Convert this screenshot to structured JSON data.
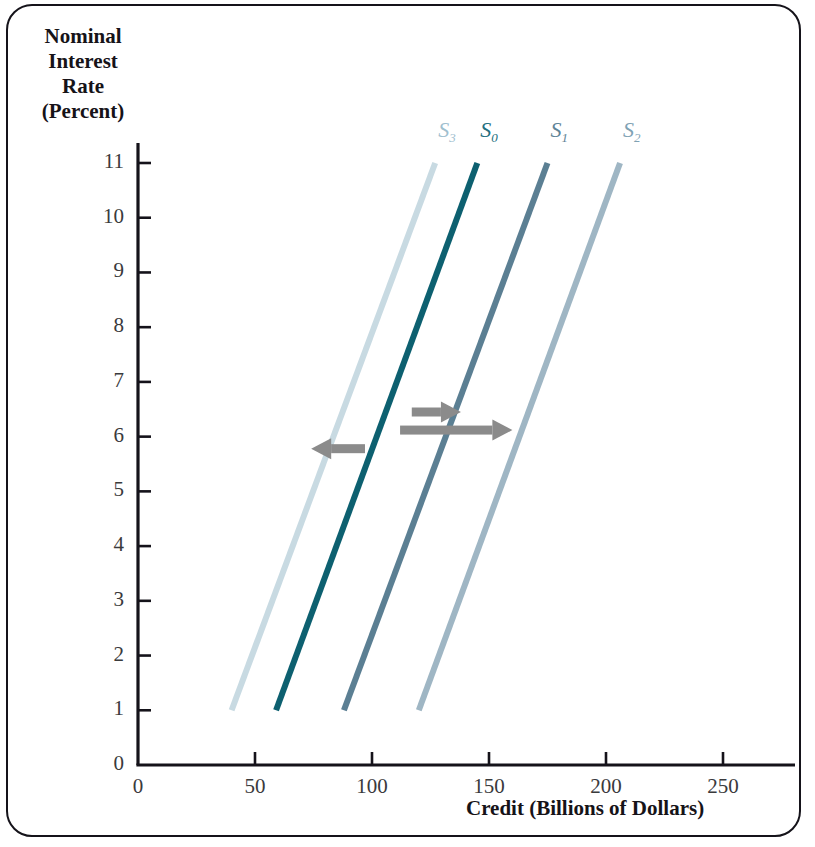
{
  "chart_data": {
    "type": "line",
    "title": "",
    "xlabel": "Credit (Billions of Dollars)",
    "ylabel": "Nominal Interest Rate (Percent)",
    "ylabel_lines": [
      "Nominal",
      "Interest",
      "Rate",
      "(Percent)"
    ],
    "xlim": [
      0,
      280
    ],
    "ylim": [
      0,
      11.6
    ],
    "xticks": [
      0,
      50,
      100,
      150,
      200,
      250
    ],
    "yticks": [
      0,
      1,
      2,
      3,
      4,
      5,
      6,
      7,
      8,
      9,
      10,
      11
    ],
    "xtick_labels": [
      "0",
      "50",
      "100",
      "150",
      "200",
      "250"
    ],
    "ytick_labels": [
      "0",
      "1",
      "2",
      "3",
      "4",
      "5",
      "6",
      "7",
      "8",
      "9",
      "10",
      "11"
    ],
    "grid": false,
    "legend": "inline-curve-labels",
    "series": [
      {
        "name": "S3",
        "label": "S",
        "subscript": "3",
        "color": "#c8dae2",
        "label_color": "#9fc0cf",
        "points": [
          [
            40,
            1
          ],
          [
            127,
            11
          ]
        ],
        "label_x": 133,
        "label_y": 11.55
      },
      {
        "name": "S0",
        "label": "S",
        "subscript": "0",
        "color": "#0d6070",
        "label_color": "#236f80",
        "points": [
          [
            59,
            1
          ],
          [
            145,
            11
          ]
        ],
        "label_x": 151,
        "label_y": 11.55
      },
      {
        "name": "S1",
        "label": "S",
        "subscript": "1",
        "color": "#5b7f93",
        "label_color": "#5f8497",
        "points": [
          [
            88,
            1
          ],
          [
            175,
            11
          ]
        ],
        "label_x": 181,
        "label_y": 11.55
      },
      {
        "name": "S2",
        "label": "S",
        "subscript": "2",
        "color": "#9fb6c4",
        "label_color": "#7fa2b4",
        "points": [
          [
            120,
            1
          ],
          [
            206,
            11
          ]
        ],
        "label_x": 212,
        "label_y": 11.55
      }
    ],
    "annotations": [
      {
        "name": "shift-right-short-arrow",
        "kind": "arrow",
        "direction": "right",
        "color": "#8b8b8b",
        "x_start": 117,
        "x_end": 138,
        "y": 6.45
      },
      {
        "name": "shift-right-long-arrow",
        "kind": "arrow",
        "direction": "right",
        "color": "#8b8b8b",
        "x_start": 112,
        "x_end": 160,
        "y": 6.12
      },
      {
        "name": "shift-left-arrow",
        "kind": "arrow",
        "direction": "left",
        "color": "#8b8b8b",
        "x_start": 97,
        "x_end": 74,
        "y": 5.78
      }
    ]
  },
  "colors": {
    "axis": "#15131a",
    "frame": "#15131a",
    "tick_text": "#3a3a3c",
    "background": "#ffffff"
  }
}
